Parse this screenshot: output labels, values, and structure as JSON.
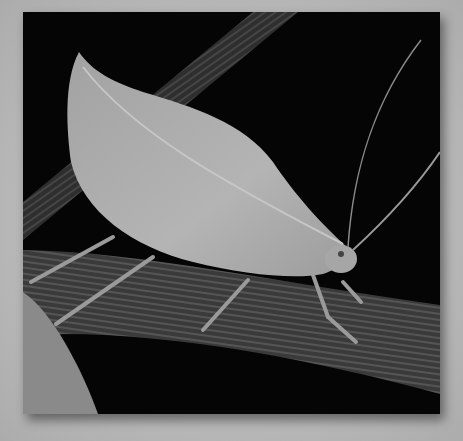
{
  "image": {
    "description": "Grayscale photograph of a leaf-mimic katydid resting on a ribbed plant stem against a black background",
    "subject": "leaf katydid",
    "colors": {
      "border": "#b9b9b9",
      "background": "#050505",
      "leaf": "#a9a9a9",
      "stem": "#3c3c3c"
    }
  }
}
